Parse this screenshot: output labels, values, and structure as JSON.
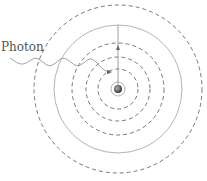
{
  "diagram": {
    "photon_label": "Photon",
    "nucleus": {
      "name": "nucleus",
      "color": "#555555"
    },
    "orbits": [
      {
        "name": "orbit-n1",
        "style": "solid"
      },
      {
        "name": "orbit-n2",
        "style": "dashed"
      },
      {
        "name": "orbit-n3",
        "style": "dashed"
      },
      {
        "name": "orbit-n4",
        "style": "dashed"
      },
      {
        "name": "orbit-n5",
        "style": "solid"
      },
      {
        "name": "orbit-n6",
        "style": "dashed"
      }
    ],
    "colors": {
      "line": "#777777",
      "solid_ring": "#aaaaaa",
      "dashed_ring": "#666666",
      "text": "#555555"
    }
  }
}
